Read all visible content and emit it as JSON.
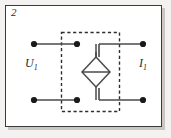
{
  "figure": {
    "panel_number": "2",
    "frame_border_color": "#3a3a3a",
    "background_color": "#ffffff",
    "shadow_color": "#c9c7c4"
  },
  "labels": {
    "left_quantity": "U",
    "left_subscript": "1",
    "right_quantity": "I",
    "right_subscript": "1"
  },
  "circuit": {
    "wire_color": "#4a4a4a",
    "dashed_box_color": "#2f2f2f",
    "terminal_dot_color": "#1a1a1a",
    "source_symbol": "diamond-dependent-source",
    "terminals": [
      {
        "name": "top-left-outer-terminal",
        "x": 34,
        "y": 44
      },
      {
        "name": "top-left-inner-terminal",
        "x": 77,
        "y": 44
      },
      {
        "name": "top-right-outer-terminal",
        "x": 143,
        "y": 44
      },
      {
        "name": "bottom-left-outer-terminal",
        "x": 34,
        "y": 100
      },
      {
        "name": "bottom-left-inner-terminal",
        "x": 77,
        "y": 100
      },
      {
        "name": "bottom-right-outer-terminal",
        "x": 143,
        "y": 100
      }
    ],
    "dashed_box": {
      "x": 61,
      "y": 32,
      "width": 59,
      "height": 80
    },
    "diamond": {
      "cx": 96,
      "cy": 72,
      "rx": 14,
      "ry": 15
    }
  }
}
